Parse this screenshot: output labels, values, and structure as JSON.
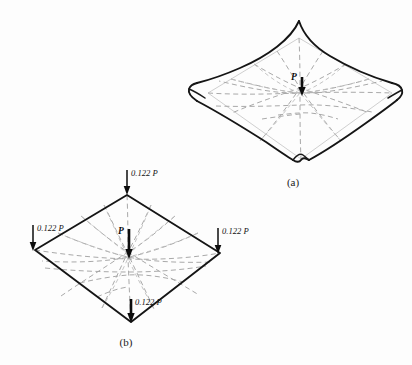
{
  "figure": {
    "background_color": "#fdfdfd",
    "line_color": "#151515",
    "grid_color": "#a9a9a9",
    "panels": [
      {
        "id": "panel-a",
        "caption": "(a)",
        "description": "deflected hypar / saddle membrane under central point load",
        "center_load_label": "P",
        "corner_loads": []
      },
      {
        "id": "panel-b",
        "caption": "(b)",
        "description": "plan of square membrane showing central load and four corner reactions",
        "center_load_label": "P",
        "corner_loads": [
          {
            "position": "top",
            "label": "0.122 P"
          },
          {
            "position": "left",
            "label": "0.122 P"
          },
          {
            "position": "right",
            "label": "0.122 P"
          },
          {
            "position": "bottom",
            "label": "0.122 P"
          }
        ]
      }
    ]
  }
}
